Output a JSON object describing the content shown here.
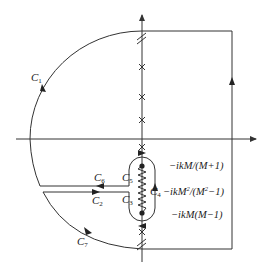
{
  "diagram": {
    "type": "contour-integration-diagram",
    "contours": [
      {
        "id": "C1",
        "letter": "C",
        "sub": "1"
      },
      {
        "id": "C2",
        "letter": "C",
        "sub": "2"
      },
      {
        "id": "C3",
        "letter": "C",
        "sub": "3"
      },
      {
        "id": "C4",
        "letter": "C",
        "sub": "4"
      },
      {
        "id": "C5",
        "letter": "C",
        "sub": "5"
      },
      {
        "id": "C6",
        "letter": "C",
        "sub": "6"
      },
      {
        "id": "C7",
        "letter": "C",
        "sub": "7"
      }
    ],
    "branch_points": {
      "upper": {
        "pre": "−ikM/(M+1)"
      },
      "middle": {
        "pre": "−ikM",
        "sup1": "2",
        "mid": "/(M",
        "sup2": "2",
        "post": "−1)"
      },
      "lower": {
        "pre": "−ikM(M−1)"
      }
    },
    "colors": {
      "line": "#333333",
      "background": "#ffffff"
    }
  }
}
